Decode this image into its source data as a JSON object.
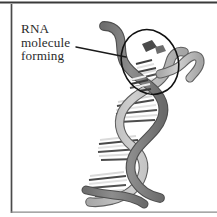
{
  "figure": {
    "background_color": "#ffffff",
    "frame": {
      "line_color": "#3a3a3a",
      "top_border": true,
      "left_border": true,
      "bottom_border": true,
      "right_border": false
    }
  },
  "callout": {
    "line1": "RNA",
    "line2": "molecule",
    "line3": "forming",
    "text_color": "#2b2b2b",
    "leader_line_color": "#1a1a1a"
  },
  "annotation": {
    "highlight_shape": "ellipse",
    "highlight_outline_color": "#111111",
    "highlight_label": "rna-forming-region"
  },
  "diagram": {
    "type": "dna-transcription",
    "strand_dark_color": "#7d7d7d",
    "strand_light_color": "#bdbdbd",
    "strand_outline_color": "#5a5a5a",
    "base_pair_light_color": "#e8e8e8",
    "base_pair_dark_color": "#4a4a4a",
    "rungs_count": 22,
    "helix_turns": 3,
    "elements": [
      "dna-strand-dark",
      "dna-strand-light",
      "base-pair-rungs",
      "rna-strand-forming",
      "template-strand-tail"
    ]
  }
}
